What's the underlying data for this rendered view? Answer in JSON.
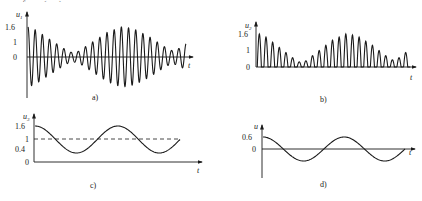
{
  "figure": {
    "truncated_top_text": "……f…g(…)……",
    "panels": [
      {
        "id": "a",
        "caption": "a)",
        "ylabel": "u",
        "ylabel_sub": "1",
        "xlabel": "t",
        "yticks": [
          "1.6",
          "1",
          "0"
        ],
        "description": "Beat signal: carrier oscillation with amplitude envelope |1.6 cos| — large at start, near zero mid-left, large again, small at right"
      },
      {
        "id": "b",
        "caption": "b)",
        "ylabel": "u",
        "ylabel_sub": "2",
        "xlabel": "t",
        "yticks": [
          "1.6",
          "1",
          "0"
        ],
        "description": "Half-wave rectified version of (a): positive lobes only"
      },
      {
        "id": "c",
        "caption": "c)",
        "ylabel": "u",
        "ylabel_sub": "3",
        "xlabel": "t",
        "yticks": [
          "1.6",
          "1",
          "0.4",
          "0"
        ],
        "dashed_level": "1",
        "description": "Envelope (low-pass) signal oscillating between 0.4 and 1.6 around DC level 1"
      },
      {
        "id": "d",
        "caption": "d)",
        "ylabel": "u",
        "ylabel_sub": "4",
        "xlabel": "t",
        "yticks": [
          "0.6",
          "0"
        ],
        "description": "DC removed: sinusoid with amplitude 0.6 about 0"
      }
    ]
  },
  "chart_data": [
    {
      "type": "line",
      "title": "a)",
      "xlabel": "t",
      "ylabel": "u1",
      "ylim": [
        -1.6,
        1.6
      ],
      "yticks": [
        0,
        1,
        1.6
      ],
      "series": [
        {
          "name": "u1",
          "formula": "(1 + 0.6*cos(w_m t)) * cos(w_c t)",
          "peak_envelope": [
            1.6,
            1.45,
            1.2,
            0.95,
            0.7,
            0.45,
            0.25,
            0.3,
            0.55,
            0.8,
            1.05,
            1.3,
            1.45,
            1.6,
            1.55,
            1.45,
            1.25,
            1.05,
            0.8,
            0.55,
            0.35,
            0.45,
            0.7
          ]
        }
      ],
      "carrier_cycles": 22,
      "grid": false
    },
    {
      "type": "line",
      "title": "b)",
      "xlabel": "t",
      "ylabel": "u2",
      "ylim": [
        0,
        1.6
      ],
      "yticks": [
        0,
        1,
        1.6
      ],
      "series": [
        {
          "name": "u2 (rectified)",
          "lobe_peaks": [
            1.6,
            1.45,
            1.2,
            0.95,
            0.7,
            0.45,
            0.25,
            0.3,
            0.55,
            0.8,
            1.05,
            1.3,
            1.45,
            1.6,
            1.55,
            1.45,
            1.25,
            1.05,
            0.8,
            0.55,
            0.35,
            0.45,
            0.7
          ]
        }
      ],
      "grid": false
    },
    {
      "type": "line",
      "title": "c)",
      "xlabel": "t",
      "ylabel": "u3",
      "ylim": [
        0,
        1.6
      ],
      "yticks": [
        0,
        0.4,
        1,
        1.6
      ],
      "series": [
        {
          "name": "u3",
          "offset": 1,
          "amplitude": 0.6,
          "cycles": 1.75
        },
        {
          "name": "DC level",
          "value": 1,
          "style": "dashed"
        }
      ],
      "grid": false
    },
    {
      "type": "line",
      "title": "d)",
      "xlabel": "t",
      "ylabel": "u4",
      "ylim": [
        -0.6,
        0.6
      ],
      "yticks": [
        0,
        0.6
      ],
      "series": [
        {
          "name": "u4",
          "offset": 0,
          "amplitude": 0.6,
          "cycles": 1.75
        }
      ],
      "grid": false
    }
  ]
}
